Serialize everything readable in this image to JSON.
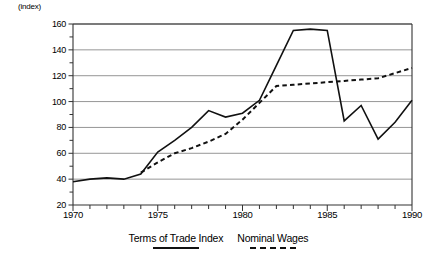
{
  "chart_data": {
    "type": "line",
    "title": "",
    "xlabel": "",
    "ylabel": "(index)",
    "ylim": [
      20,
      160
    ],
    "xlim": [
      1970,
      1990
    ],
    "ytick_step": 20,
    "yticks": [
      20,
      40,
      60,
      80,
      100,
      120,
      140,
      160
    ],
    "ytick_labels": [
      "20",
      "40",
      "60",
      "80",
      "100",
      "120",
      "140",
      "160"
    ],
    "minor_ytick_step": 10,
    "xticks": [
      1970,
      1971,
      1972,
      1973,
      1974,
      1975,
      1976,
      1977,
      1978,
      1979,
      1980,
      1981,
      1982,
      1983,
      1984,
      1985,
      1986,
      1987,
      1988,
      1989,
      1990
    ],
    "xtick_labels_major": [
      "1970",
      "1975",
      "1980",
      "1985",
      "1990"
    ],
    "xticks_major": [
      1970,
      1975,
      1980,
      1985,
      1990
    ],
    "grid": "horizontal",
    "legend_position": "bottom",
    "series": [
      {
        "name": "Terms of Trade Index",
        "style": "solid",
        "color": "#111111",
        "x": [
          1970,
          1971,
          1972,
          1973,
          1974,
          1975,
          1976,
          1977,
          1978,
          1979,
          1980,
          1981,
          1982,
          1983,
          1984,
          1985,
          1986,
          1987,
          1988,
          1989,
          1990
        ],
        "values": [
          38,
          40,
          41,
          40,
          44,
          61,
          70,
          80,
          93,
          88,
          91,
          101,
          128,
          155,
          156,
          155,
          85,
          97,
          71,
          84,
          101
        ]
      },
      {
        "name": "Nominal Wages",
        "style": "dashed",
        "color": "#111111",
        "x": [
          1974,
          1975,
          1976,
          1977,
          1978,
          1979,
          1980,
          1981,
          1982,
          1983,
          1984,
          1985,
          1986,
          1987,
          1988,
          1989,
          1990
        ],
        "values": [
          45,
          53,
          60,
          64,
          69,
          75,
          86,
          99,
          112,
          113,
          114,
          115,
          116,
          117,
          118,
          122,
          126
        ]
      }
    ]
  },
  "legend": {
    "items": [
      {
        "label": "Terms of Trade Index",
        "style": "solid"
      },
      {
        "label": "Nominal Wages",
        "style": "dashed"
      }
    ]
  }
}
